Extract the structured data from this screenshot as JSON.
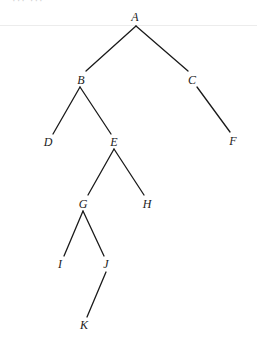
{
  "top_fragment": "···  ···",
  "nodes": {
    "A": {
      "label": "A",
      "x": 135,
      "y": 17
    },
    "B": {
      "label": "B",
      "x": 81,
      "y": 80
    },
    "C": {
      "label": "C",
      "x": 192,
      "y": 80
    },
    "D": {
      "label": "D",
      "x": 48,
      "y": 142
    },
    "E": {
      "label": "E",
      "x": 114,
      "y": 142
    },
    "F": {
      "label": "F",
      "x": 233,
      "y": 141
    },
    "G": {
      "label": "G",
      "x": 83,
      "y": 204
    },
    "H": {
      "label": "H",
      "x": 147,
      "y": 204
    },
    "I": {
      "label": "I",
      "x": 60,
      "y": 264
    },
    "J": {
      "label": "J",
      "x": 106,
      "y": 264
    },
    "K": {
      "label": "K",
      "x": 84,
      "y": 325
    }
  },
  "edges": [
    {
      "from": "A",
      "to": "B",
      "x1": 136,
      "y1": 26,
      "x2": 86,
      "y2": 71
    },
    {
      "from": "A",
      "to": "C",
      "x1": 136,
      "y1": 26,
      "x2": 188,
      "y2": 71
    },
    {
      "from": "B",
      "to": "D",
      "x1": 80,
      "y1": 87,
      "x2": 53,
      "y2": 134
    },
    {
      "from": "B",
      "to": "E",
      "x1": 80,
      "y1": 87,
      "x2": 111,
      "y2": 134
    },
    {
      "from": "C",
      "to": "F",
      "x1": 197,
      "y1": 87,
      "x2": 230,
      "y2": 132
    },
    {
      "from": "E",
      "to": "G",
      "x1": 114,
      "y1": 149,
      "x2": 88,
      "y2": 195
    },
    {
      "from": "E",
      "to": "H",
      "x1": 114,
      "y1": 149,
      "x2": 144,
      "y2": 195
    },
    {
      "from": "G",
      "to": "I",
      "x1": 83,
      "y1": 211,
      "x2": 64,
      "y2": 256
    },
    {
      "from": "G",
      "to": "J",
      "x1": 83,
      "y1": 211,
      "x2": 104,
      "y2": 256
    },
    {
      "from": "J",
      "to": "K",
      "x1": 106,
      "y1": 272,
      "x2": 87,
      "y2": 317
    }
  ]
}
